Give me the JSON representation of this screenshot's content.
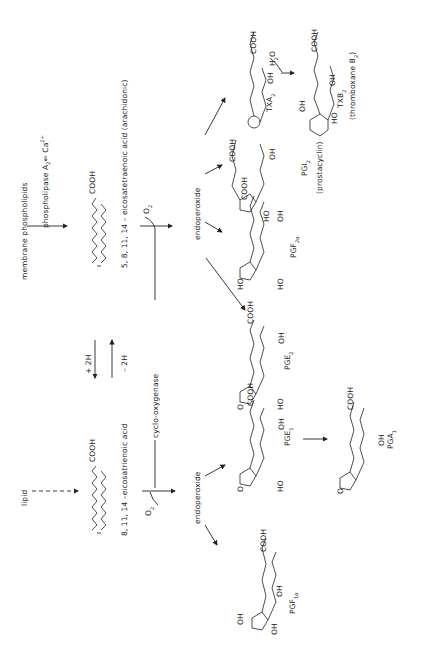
{
  "diagram": {
    "orientation": "rotated-90-ccw",
    "nodes": {
      "membrane_phospholipids": "membrane phospholipids",
      "lipid": "lipid",
      "phospholipase": "phospholipase A",
      "phospholipase_sub": "2",
      "ca": "⇐ Ca",
      "ca_sup": "2+",
      "arachidonic": "5, 8, 11, 14 – eicosatetraenoic acid (arachidonic)",
      "eicosatrienoic": "8, 11, 14 –eicosatrienoic acid",
      "plus2h": "+ 2H",
      "minus2h": "– 2H",
      "cyclooxygenase": "cyclo-oxygenase",
      "o2_top": "O",
      "o2_top_sub": "2",
      "o2_bottom": "O",
      "o2_bottom_sub": "2",
      "endoperoxide_top": "endoperoxide",
      "endoperoxide_bottom": "endoperoxide",
      "pgf1a": "PGF",
      "pgf1a_sub": "1α",
      "pge1": "PGE",
      "pge1_sub": "1",
      "pga1": "PGA",
      "pga1_sub": "1",
      "pge2": "PGE",
      "pge2_sub": "2",
      "pgf2a": "PGF",
      "pgf2a_sub": "2α",
      "pgi2": "PGI",
      "pgi2_sub": "2",
      "prostacyclin": "(prostacyclin)",
      "txa2": "TXA",
      "txa2_sub": "2",
      "h2o": "H",
      "h2o_sub": "2",
      "h2o_tail": "O",
      "txb2": "TXB",
      "txb2_sub": "2",
      "thromboxane": "(thromboxane B",
      "thromboxane_sub": "2",
      "thromboxane_tail": ")",
      "cooh": "COOH",
      "oh": "OH",
      "ho": "HO",
      "o": "O",
      "h": "H"
    },
    "edges": [
      {
        "from": "membrane phospholipids",
        "to": "arachidonic acid",
        "label": "phospholipase A2 ⇐ Ca2+"
      },
      {
        "from": "lipid",
        "to": "8,11,14-eicosatrienoic acid",
        "style": "dashed"
      },
      {
        "from": "8,11,14-eicosatrienoic acid",
        "to": "arachidonic acid",
        "label": "– 2H"
      },
      {
        "from": "arachidonic acid",
        "to": "8,11,14-eicosatrienoic acid",
        "label": "+ 2H"
      },
      {
        "from": "arachidonic acid",
        "to": "endoperoxide (2-series)",
        "label": "O2, cyclo-oxygenase"
      },
      {
        "from": "8,11,14-eicosatrienoic acid",
        "to": "endoperoxide (1-series)",
        "label": "O2, cyclo-oxygenase"
      },
      {
        "from": "endoperoxide (1-series)",
        "to": "PGF1α"
      },
      {
        "from": "endoperoxide (1-series)",
        "to": "PGE1"
      },
      {
        "from": "PGE1",
        "to": "PGA1"
      },
      {
        "from": "endoperoxide (2-series)",
        "to": "PGE2"
      },
      {
        "from": "endoperoxide (2-series)",
        "to": "PGF2α"
      },
      {
        "from": "endoperoxide (2-series)",
        "to": "PGI2"
      },
      {
        "from": "endoperoxide (2-series)",
        "to": "TXA2"
      },
      {
        "from": "TXA2",
        "to": "TXB2",
        "label": "H2O"
      }
    ]
  }
}
